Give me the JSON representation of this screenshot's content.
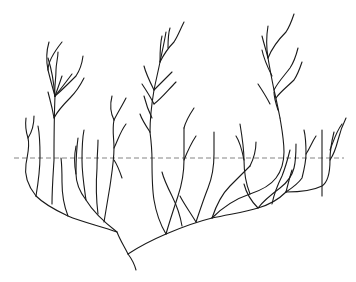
{
  "diagram": {
    "type": "branching-tree",
    "width": 356,
    "height": 282,
    "colors": {
      "background": "#ffffff",
      "branch": "#1a1a1a",
      "reference_line": "#777777"
    },
    "reference_line": {
      "style": "dashed",
      "x1": 14,
      "x2": 344,
      "y": 158
    },
    "branches": [
      {
        "id": "trunk",
        "d": "M136 270 C134 262 131 258 128 254"
      },
      {
        "id": "left-main",
        "d": "M128 254 C124 246 120 240 117 232 C100 226 82 222 68 216 C55 210 44 204 36 196"
      },
      {
        "id": "left-leaf-1",
        "d": "M36 196 C28 186 24 176 26 164 C28 152 30 146 28 138 C26 132 25 126 26 118"
      },
      {
        "id": "left-leaf-1b",
        "d": "M28 138 C32 132 34 126 34 116"
      },
      {
        "id": "left-leaf-2",
        "d": "M36 196 C38 184 40 170 40 156 C40 146 40 136 38 126"
      },
      {
        "id": "left-leaf-3",
        "d": "M52 204 C52 190 53 176 54 160 C54 140 54 120 55 96"
      },
      {
        "id": "left-leaf-4",
        "d": "M68 216 C64 206 62 196 62 182 C62 174 62 166 61 158"
      },
      {
        "id": "left-upper-stem",
        "d": "M55 96 C52 86 50 78 48 70 C46 60 46 52 49 42"
      },
      {
        "id": "left-upper-a",
        "d": "M48 70 C48 62 54 52 62 42"
      },
      {
        "id": "left-upper-b",
        "d": "M55 96 C54 88 56 80 56 70 C56 64 58 58 58 52"
      },
      {
        "id": "left-upper-c",
        "d": "M55 96 C58 88 60 82 62 76"
      },
      {
        "id": "left-upper-d",
        "d": "M55 96 C60 90 66 82 72 74"
      },
      {
        "id": "left-upper-e",
        "d": "M55 96 C54 100 56 84 48 58"
      },
      {
        "id": "left-upper-f",
        "d": "M55 96 C60 92 68 84 76 76 C80 70 82 64 83 56"
      },
      {
        "id": "left-upper-g",
        "d": "M54 118 C58 110 64 104 70 98 C76 92 80 86 84 78"
      },
      {
        "id": "left-upper-h",
        "d": "M54 118 C52 106 50 100 48 92"
      },
      {
        "id": "mid-left-branch",
        "d": "M117 232 C104 222 92 210 86 200 C80 192 76 184 76 174 C76 164 76 152 78 138"
      },
      {
        "id": "mid-left-leaf-a",
        "d": "M86 200 C84 186 82 174 82 160 C82 148 82 140 84 130"
      },
      {
        "id": "mid-left-leaf-b",
        "d": "M98 214 C96 198 96 182 97 168 C97 156 98 148 98 140"
      },
      {
        "id": "mid-left-leaf-c",
        "d": "M76 174 C74 164 74 156 76 146"
      },
      {
        "id": "mid-left-leaf-d",
        "d": "M104 222 C106 210 108 198 110 186 C112 172 114 160 114 148 C114 138 112 130 114 120"
      },
      {
        "id": "mid-left-leaf-e",
        "d": "M114 148 C118 140 120 132 126 124"
      },
      {
        "id": "mid-left-leaf-f",
        "d": "M114 120 C110 112 110 104 112 96"
      },
      {
        "id": "mid-left-leaf-g",
        "d": "M114 120 C118 112 122 106 126 98"
      },
      {
        "id": "mid-left-leaf-h",
        "d": "M114 160 C118 166 120 172 122 178"
      },
      {
        "id": "right-main",
        "d": "M128 254 C140 246 152 240 166 234 C180 228 196 222 212 218 C230 214 246 212 258 208 C272 204 280 198 286 192"
      },
      {
        "id": "center-a",
        "d": "M166 234 C160 224 156 212 154 200 C152 188 152 174 152 160 C152 148 151 140 150 132"
      },
      {
        "id": "center-b",
        "d": "M166 234 C170 220 174 208 178 196 C182 184 184 172 184 160 C184 148 184 138 184 128"
      },
      {
        "id": "center-c",
        "d": "M182 226 C180 214 176 204 172 196 C168 188 164 180 162 172"
      },
      {
        "id": "center-d",
        "d": "M196 222 C200 210 204 198 208 188 C212 178 214 166 214 154 C214 146 214 140 214 132"
      },
      {
        "id": "center-e",
        "d": "M196 222 C190 212 184 204 180 196"
      },
      {
        "id": "center-f",
        "d": "M212 218 C216 206 222 194 230 186 C238 178 244 172 250 166"
      },
      {
        "id": "center-stem",
        "d": "M150 132 C150 116 152 102 154 90 C156 80 158 72 160 62 C162 52 164 44 166 32"
      },
      {
        "id": "center-up-a",
        "d": "M160 62 C164 54 168 48 174 42 C178 36 180 30 184 22"
      },
      {
        "id": "center-up-b",
        "d": "M154 90 C150 82 146 74 144 66"
      },
      {
        "id": "center-up-c",
        "d": "M154 90 C160 84 166 78 172 72"
      },
      {
        "id": "center-up-d",
        "d": "M154 104 C150 96 146 90 142 84"
      },
      {
        "id": "center-up-e",
        "d": "M154 104 C162 98 168 90 176 82"
      },
      {
        "id": "center-up-f",
        "d": "M152 118 C148 110 146 104 144 96"
      },
      {
        "id": "center-up-g",
        "d": "M160 62 C160 52 160 44 162 36"
      },
      {
        "id": "center-up-h",
        "d": "M168 48 C168 40 168 34 170 28"
      },
      {
        "id": "center-low-a",
        "d": "M150 132 C146 126 142 120 140 114"
      },
      {
        "id": "center-low-b",
        "d": "M184 128 C186 120 190 114 194 108"
      },
      {
        "id": "center-low-c",
        "d": "M184 160 C188 150 192 142 196 136"
      },
      {
        "id": "right-branch-1",
        "d": "M212 218 C224 206 238 198 250 194 C262 190 270 186 276 178 C282 170 284 162 284 152 C284 140 282 130 280 118"
      },
      {
        "id": "right-stem-up",
        "d": "M280 118 C278 108 276 98 274 90 C272 80 270 70 268 58 C266 46 266 38 268 26"
      },
      {
        "id": "right-up-a",
        "d": "M268 58 C272 48 278 40 286 32 C290 26 292 20 294 14"
      },
      {
        "id": "right-up-b",
        "d": "M274 90 C278 82 284 76 290 68 C294 62 296 56 298 48"
      },
      {
        "id": "right-up-c",
        "d": "M276 98 C280 92 288 86 294 80 C298 74 300 68 302 62"
      },
      {
        "id": "right-up-d",
        "d": "M272 76 C268 68 264 60 262 50"
      },
      {
        "id": "right-up-e",
        "d": "M270 104 C266 96 262 90 258 84"
      },
      {
        "id": "right-up-f",
        "d": "M278 110 C276 104 274 98 274 92"
      },
      {
        "id": "right-up-g",
        "d": "M268 58 C266 50 264 44 262 36"
      },
      {
        "id": "right-mid-a",
        "d": "M250 194 C246 184 244 172 244 160 C244 148 242 136 240 124"
      },
      {
        "id": "right-mid-b",
        "d": "M244 160 C242 150 240 142 236 136"
      },
      {
        "id": "right-mid-c",
        "d": "M250 166 C254 158 256 150 256 142"
      },
      {
        "id": "right-far-1",
        "d": "M258 208 C250 200 246 192 244 184"
      },
      {
        "id": "right-far-2",
        "d": "M258 208 C264 200 272 194 280 188 C288 182 292 176 294 168 C296 160 296 152 296 144"
      },
      {
        "id": "right-far-3",
        "d": "M272 204 C274 194 278 184 282 176 C286 166 288 158 290 150"
      },
      {
        "id": "right-far-4",
        "d": "M286 192 C292 188 298 184 302 178 C304 170 306 162 306 154 C306 146 306 138 304 130"
      },
      {
        "id": "right-far-5",
        "d": "M286 192 C288 184 290 176 292 170"
      },
      {
        "id": "right-far-6",
        "d": "M306 154 C310 148 312 142 316 136"
      },
      {
        "id": "right-tip-a",
        "d": "M322 196 C322 184 322 172 322 160 C322 148 322 138 322 130"
      },
      {
        "id": "right-tip-b",
        "d": "M286 192 C300 192 314 190 322 186 C328 182 330 172 330 160 C330 150 332 140 334 132"
      },
      {
        "id": "right-tip-c",
        "d": "M330 160 C334 154 336 148 338 140 C340 132 342 126 346 118"
      },
      {
        "id": "right-tip-d",
        "d": "M330 150 C334 140 336 132 342 124"
      }
    ]
  }
}
